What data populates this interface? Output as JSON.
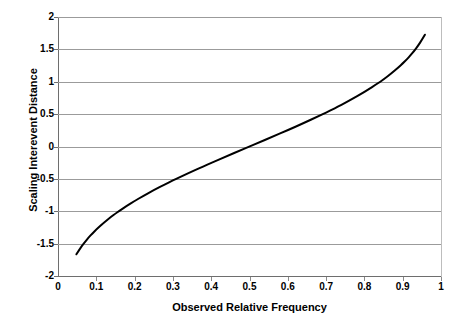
{
  "chart_data": {
    "type": "line",
    "title": "",
    "xlabel": "Observed Relative Frequency",
    "ylabel": "Scaling Interevent Distance",
    "xlim": [
      0,
      1
    ],
    "ylim": [
      -2,
      2
    ],
    "xticks": [
      "0",
      "0.1",
      "0.2",
      "0.3",
      "0.4",
      "0.5",
      "0.6",
      "0.7",
      "0.8",
      "0.9",
      "1"
    ],
    "xtick_values": [
      0,
      0.1,
      0.2,
      0.3,
      0.4,
      0.5,
      0.6,
      0.7,
      0.8,
      0.9,
      1
    ],
    "yticks": [
      "2",
      "1.5",
      "1",
      "0.5",
      "0",
      "-0.5",
      "-1",
      "-1.5",
      "-2"
    ],
    "ytick_values": [
      2,
      1.5,
      1,
      0.5,
      0,
      -0.5,
      -1,
      -1.5,
      -2
    ],
    "grid": "horizontal",
    "legend": "none",
    "series": [
      {
        "name": "Scaling Interevent Distance",
        "color": "#000000",
        "line_width": 2,
        "x": [
          0.048,
          0.06,
          0.07,
          0.08,
          0.09,
          0.1,
          0.12,
          0.14,
          0.15,
          0.16,
          0.18,
          0.2,
          0.22,
          0.25,
          0.28,
          0.3,
          0.32,
          0.35,
          0.38,
          0.4,
          0.44,
          0.48,
          0.5,
          0.52,
          0.56,
          0.6,
          0.64,
          0.68,
          0.7,
          0.72,
          0.76,
          0.8,
          0.84,
          0.85,
          0.87,
          0.89,
          0.9,
          0.91,
          0.92,
          0.93,
          0.94,
          0.95,
          0.958
        ],
        "y": [
          -1.665,
          -1.555,
          -1.476,
          -1.405,
          -1.341,
          -1.282,
          -1.175,
          -1.08,
          -1.036,
          -0.994,
          -0.915,
          -0.842,
          -0.772,
          -0.674,
          -0.583,
          -0.524,
          -0.468,
          -0.385,
          -0.305,
          -0.253,
          -0.151,
          -0.05,
          0.0,
          0.05,
          0.151,
          0.253,
          0.358,
          0.468,
          0.524,
          0.583,
          0.706,
          0.842,
          0.994,
          1.036,
          1.126,
          1.227,
          1.282,
          1.341,
          1.405,
          1.476,
          1.555,
          1.645,
          1.727
        ]
      }
    ]
  },
  "axes": {
    "y_title": "Scaling Interevent Distance",
    "x_title": "Observed Relative Frequency",
    "y_tick_labels": [
      "2",
      "1.5",
      "1",
      "0.5",
      "0",
      "-0.5",
      "-1",
      "-1.5",
      "-2"
    ],
    "x_tick_labels": [
      "0",
      "0.1",
      "0.2",
      "0.3",
      "0.4",
      "0.5",
      "0.6",
      "0.7",
      "0.8",
      "0.9",
      "1"
    ]
  },
  "colors": {
    "curve": "#000000",
    "gridline": "#9b9b9b",
    "axis": "#6e6e6e",
    "background": "#ffffff"
  }
}
